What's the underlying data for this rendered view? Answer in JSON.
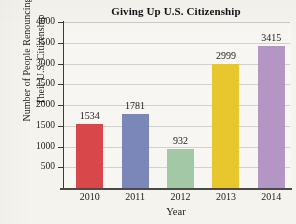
{
  "chart_data": {
    "type": "bar",
    "title": "Giving Up U.S. Citizenship",
    "xlabel": "Year",
    "ylabel_line1": "Number of People Renouncing",
    "ylabel_line2": "Their U.S. Citizenship",
    "categories": [
      "2010",
      "2011",
      "2012",
      "2013",
      "2014"
    ],
    "values": [
      1534,
      1781,
      932,
      2999,
      3415
    ],
    "value_labels": [
      "1534",
      "1781",
      "932",
      "2999",
      "3415"
    ],
    "bar_colors": [
      "#d8474a",
      "#7a87b8",
      "#a3c8a5",
      "#e8c72e",
      "#b396c4"
    ],
    "ylim": [
      0,
      4000
    ],
    "ytick_labels": [
      "4000",
      "3500",
      "3000",
      "2500",
      "2000",
      "1500",
      "1000",
      "500"
    ],
    "ytick_values": [
      4000,
      3500,
      3000,
      2500,
      2000,
      1500,
      1000,
      500
    ],
    "grid": true,
    "legend": "none",
    "background_color": "#f4f3ee",
    "plot_background_color": "#f7f6f2",
    "gridline_color": "#d2d2cd",
    "axis_color": "#3a3a38"
  }
}
